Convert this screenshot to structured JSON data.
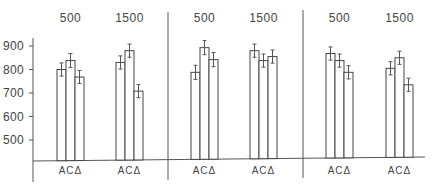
{
  "chart_data": {
    "type": "bar",
    "title": "",
    "xlabel": "",
    "ylabel": "",
    "ylim": [
      410,
      940
    ],
    "yticks": [
      500,
      600,
      700,
      800,
      900
    ],
    "grid": false,
    "legend": null,
    "categories": [
      "A",
      "C",
      "Δ"
    ],
    "panels": [
      {
        "groups": [
          {
            "label": "500",
            "values": [
              800,
              838,
              768
            ],
            "errors": [
              28,
              30,
              28
            ]
          },
          {
            "label": "1500",
            "values": [
              830,
              880,
              708
            ],
            "errors": [
              28,
              28,
              28
            ]
          }
        ]
      },
      {
        "groups": [
          {
            "label": "500",
            "values": [
              788,
              893,
              842
            ],
            "errors": [
              30,
              30,
              30
            ]
          },
          {
            "label": "1500",
            "values": [
              880,
              838,
              855
            ],
            "errors": [
              28,
              28,
              28
            ]
          }
        ]
      },
      {
        "groups": [
          {
            "label": "500",
            "values": [
              868,
              838,
              788
            ],
            "errors": [
              28,
              28,
              28
            ]
          },
          {
            "label": "1500",
            "values": [
              805,
              850,
              735
            ],
            "errors": [
              28,
              28,
              28
            ]
          }
        ]
      }
    ]
  },
  "axis": {
    "tick_labels": [
      "900",
      "800",
      "700",
      "600",
      "500"
    ]
  },
  "category_label": "ACΔ"
}
